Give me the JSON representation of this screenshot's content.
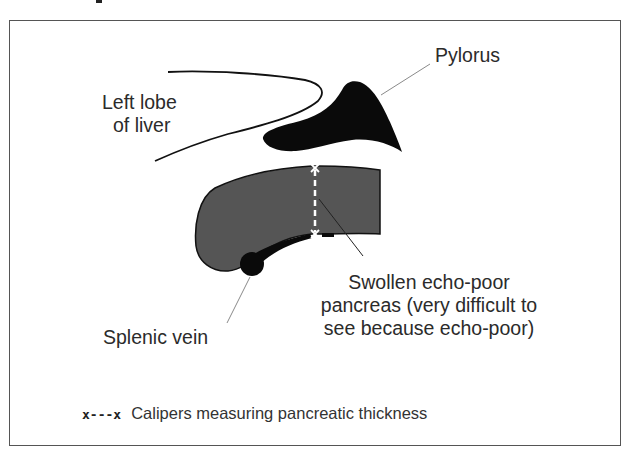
{
  "diagram": {
    "type": "ultrasound-schematic",
    "heading_fragment": ".",
    "colors": {
      "frame": "#555555",
      "pancreas_fill": "#555555",
      "solid_structures": "#0a0a0a",
      "leader_lines": "#888888",
      "calipers": "#ffffff"
    },
    "labels": {
      "left_lobe_line1": "Left lobe",
      "left_lobe_line2": "of liver",
      "pylorus": "Pylorus",
      "pancreas_line1": "Swollen echo-poor",
      "pancreas_line2": "pancreas (very difficult to",
      "pancreas_line3": "see because echo-poor)",
      "splenic_vein": "Splenic vein"
    },
    "legend": {
      "symbol": "x---x",
      "text": "Calipers measuring pancreatic thickness"
    }
  }
}
